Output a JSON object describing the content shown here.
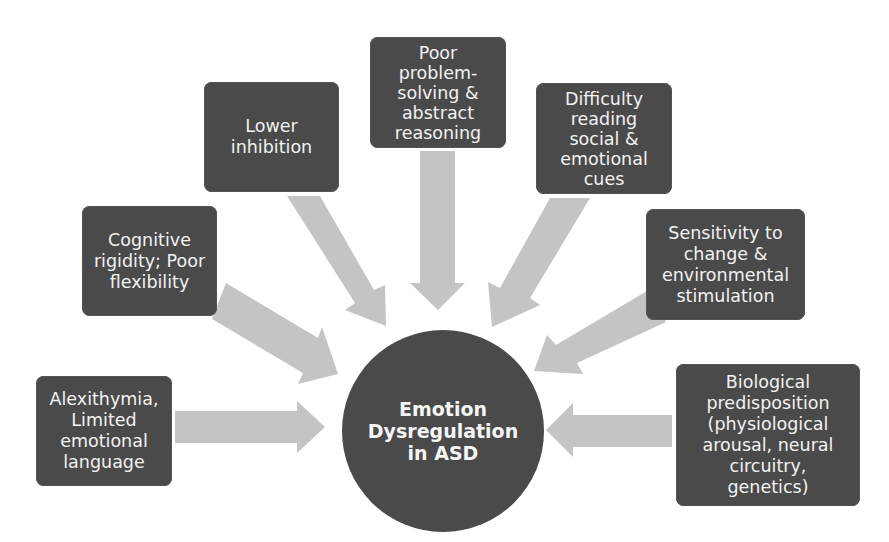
{
  "diagram": {
    "center": {
      "label": "Emotion\nDysregulation\nin ASD"
    },
    "factors": [
      {
        "id": "alexithymia",
        "label": "Alexithymia,\nLimited\nemotional\nlanguage"
      },
      {
        "id": "cognitive-rigidity",
        "label": "Cognitive\nrigidity; Poor\nflexibility"
      },
      {
        "id": "lower-inhibition",
        "label": "Lower\ninhibition"
      },
      {
        "id": "poor-problem-solving",
        "label": "Poor\nproblem-\nsolving &\nabstract\nreasoning"
      },
      {
        "id": "difficulty-reading-cues",
        "label": "Difficulty\nreading\nsocial &\nemotional\ncues"
      },
      {
        "id": "sensitivity-to-change",
        "label": "Sensitivity to\nchange &\nenvironmental\nstimulation"
      },
      {
        "id": "biological-predisposition",
        "label": "Biological\npredisposition\n(physiological\narousal, neural\ncircuitry,\ngenetics)"
      }
    ],
    "colors": {
      "box": "#4a4a4a",
      "text": "#f2f2f2",
      "arrow": "#c4c4c4",
      "background": "#ffffff"
    }
  }
}
